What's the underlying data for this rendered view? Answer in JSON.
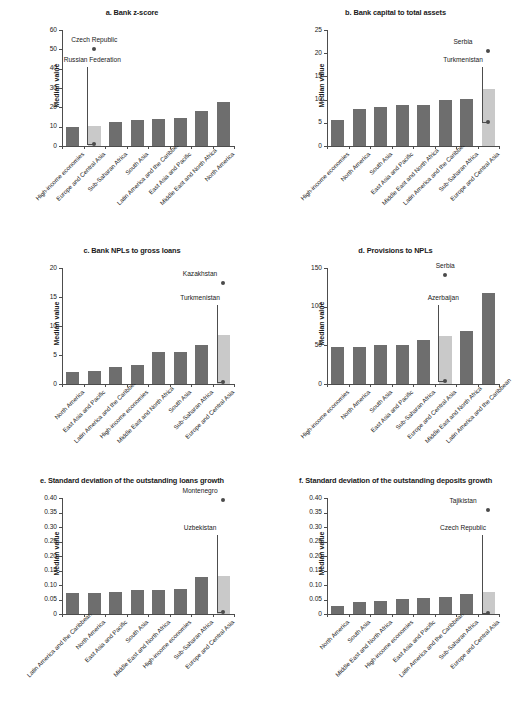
{
  "figure": {
    "ylabel": "Median value",
    "bar_color": "#6e6e6e",
    "highlight_color": "#c9c9c9",
    "dot_color": "#4a4a4a"
  },
  "chart_data": [
    {
      "id": "a",
      "type": "bar",
      "title": "a. Bank z-score",
      "ylabel": "Median value",
      "xlabel": "",
      "ylim": [
        0,
        60
      ],
      "yticks": [
        0,
        10,
        20,
        30,
        40,
        50,
        60
      ],
      "ytick_labels": [
        "0",
        "10",
        "20",
        "30",
        "40",
        "50",
        "60"
      ],
      "grid": false,
      "legend": "none",
      "categories": [
        "High-income economies",
        "Europe and Central Asia",
        "Sub-Saharan Africa",
        "South Asia",
        "Latin America and the Caribbean",
        "East Asia and Pacific",
        "Middle East and North Africa",
        "North America"
      ],
      "values": [
        9.8,
        10.4,
        12.6,
        13.5,
        13.8,
        14.6,
        18.1,
        22.6
      ],
      "highlight_index": 1,
      "annotations": [
        {
          "label": "Czech Republic",
          "value": 50.3,
          "category_index": 1,
          "style": "dot-above"
        },
        {
          "label": "Russian Federation",
          "value": 1.1,
          "category_index": 1,
          "style": "leader-dot"
        }
      ]
    },
    {
      "id": "b",
      "type": "bar",
      "title": "b. Bank capital to total assets",
      "ylabel": "Median value",
      "xlabel": "",
      "ylim": [
        0,
        25
      ],
      "yticks": [
        0,
        5,
        10,
        15,
        20,
        25
      ],
      "ytick_labels": [
        "0",
        "5",
        "10",
        "15",
        "20",
        "25"
      ],
      "grid": false,
      "legend": "none",
      "categories": [
        "High-income economies",
        "North America",
        "South Asia",
        "East Asia and Pacific",
        "Middle East and North Africa",
        "Latin America and the Caribbean",
        "Sub-Saharan Africa",
        "Europe and Central Asia"
      ],
      "values": [
        5.7,
        8.0,
        8.5,
        8.8,
        8.9,
        10.0,
        10.1,
        12.2
      ],
      "highlight_index": 7,
      "annotations": [
        {
          "label": "Serbia",
          "value": 20.4,
          "category_index": 7,
          "style": "dot-above"
        },
        {
          "label": "Turkmenistan",
          "value": 5.1,
          "category_index": 7,
          "style": "leader-dot"
        }
      ]
    },
    {
      "id": "c",
      "type": "bar",
      "title": "c. Bank NPLs to gross loans",
      "ylabel": "Median value",
      "xlabel": "",
      "ylim": [
        0,
        20
      ],
      "yticks": [
        0,
        5,
        10,
        15,
        20
      ],
      "ytick_labels": [
        "0",
        "5",
        "10",
        "15",
        "20"
      ],
      "grid": false,
      "legend": "none",
      "categories": [
        "North America",
        "East Asia and Pacific",
        "Latin America and the Caribbean",
        "High-income economies",
        "Middle East and North Africa",
        "South Asia",
        "Sub-Saharan Africa",
        "Europe and Central Asia"
      ],
      "values": [
        2.0,
        2.2,
        2.9,
        3.3,
        5.6,
        5.6,
        6.8,
        8.5
      ],
      "highlight_index": 7,
      "annotations": [
        {
          "label": "Kazakhstan",
          "value": 17.4,
          "category_index": 7,
          "style": "dot-above"
        },
        {
          "label": "Turkmenistan",
          "value": 0.3,
          "category_index": 7,
          "style": "leader-dot"
        }
      ]
    },
    {
      "id": "d",
      "type": "bar",
      "title": "d. Provisions to NPLs",
      "ylabel": "Median value",
      "xlabel": "",
      "ylim": [
        0,
        150
      ],
      "yticks": [
        0,
        50,
        100,
        150
      ],
      "ytick_labels": [
        "0",
        "50",
        "100",
        "150"
      ],
      "grid": false,
      "legend": "none",
      "categories": [
        "High-income economies",
        "North America",
        "South Asia",
        "East Asia and Pacific",
        "Sub-Saharan Africa",
        "Europe and Central Asia",
        "Middle East and North Africa",
        "Latin America and the Caribbean"
      ],
      "values": [
        47.5,
        47.5,
        50.0,
        50.8,
        56.8,
        61.5,
        68.0,
        118.0
      ],
      "highlight_index": 5,
      "annotations": [
        {
          "label": "Serbia",
          "value": 141.0,
          "category_index": 5,
          "style": "dot-above"
        },
        {
          "label": "Azerbaijan",
          "value": 3.5,
          "category_index": 5,
          "style": "leader-dot"
        }
      ]
    },
    {
      "id": "e",
      "type": "bar",
      "title": "e. Standard deviation of the outstanding loans growth",
      "ylabel": "Median value",
      "xlabel": "",
      "ylim": [
        0,
        0.4
      ],
      "yticks": [
        0,
        0.05,
        0.1,
        0.15,
        0.2,
        0.25,
        0.3,
        0.35,
        0.4
      ],
      "ytick_labels": [
        "0",
        "0.05",
        "0.10",
        "0.15",
        "0.20",
        "0.25",
        "0.30",
        "0.35",
        "0.40"
      ],
      "grid": false,
      "legend": "none",
      "categories": [
        "Latin America and the Caribbean",
        "North America",
        "East Asia and Pacific",
        "South Asia",
        "Middle East and North Africa",
        "High-income economies",
        "Sub-Saharan Africa",
        "Europe and Central Asia"
      ],
      "values": [
        0.071,
        0.073,
        0.077,
        0.082,
        0.084,
        0.087,
        0.126,
        0.13
      ],
      "highlight_index": 7,
      "annotations": [
        {
          "label": "Montenegro",
          "value": 0.394,
          "category_index": 7,
          "style": "dot-above"
        },
        {
          "label": "Uzbekistan",
          "value": 0.006,
          "category_index": 7,
          "style": "leader-dot"
        }
      ]
    },
    {
      "id": "f",
      "type": "bar",
      "title": "f. Standard deviation of the outstanding deposits growth",
      "ylabel": "Median value",
      "xlabel": "",
      "ylim": [
        0,
        0.4
      ],
      "yticks": [
        0,
        0.05,
        0.1,
        0.15,
        0.2,
        0.25,
        0.3,
        0.35,
        0.4
      ],
      "ytick_labels": [
        "0",
        "0.05",
        "0.10",
        "0.15",
        "0.20",
        "0.25",
        "0.30",
        "0.35",
        "0.40"
      ],
      "grid": false,
      "legend": "none",
      "categories": [
        "North America",
        "South Asia",
        "Middle East and North Africa",
        "High-income economies",
        "East Asia and Pacific",
        "Latin America and the Caribbean",
        "Sub-Saharan Africa",
        "Europe and Central Asia"
      ],
      "values": [
        0.027,
        0.04,
        0.046,
        0.052,
        0.055,
        0.06,
        0.07,
        0.077
      ],
      "highlight_index": 7,
      "annotations": [
        {
          "label": "Tajikistan",
          "value": 0.358,
          "category_index": 7,
          "style": "dot-above"
        },
        {
          "label": "Czech Republic",
          "value": 0.004,
          "category_index": 7,
          "style": "leader-dot"
        }
      ]
    }
  ]
}
